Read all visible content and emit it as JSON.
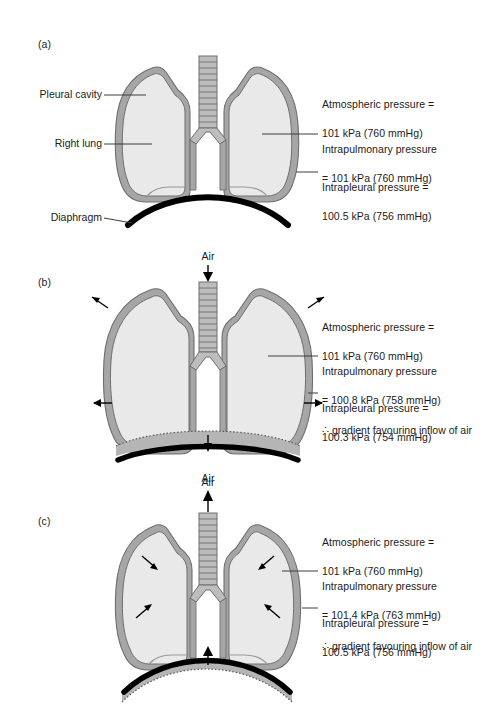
{
  "figure": {
    "background_color": "#ffffff",
    "lung_fill_color": "#e9e9e9",
    "pleura_color": "#a6a6a6",
    "diaphragm_color": "#000000",
    "outline_color": "#6e6e6e",
    "text_color": "#1b1b1b"
  },
  "panels": [
    {
      "id": "a",
      "label": "(a)",
      "state": "resting / end of expiration",
      "air_label_top": null,
      "air_label_bottom": null,
      "left_labels": [
        {
          "name": "pleural-cavity",
          "text": "Pleural cavity"
        },
        {
          "name": "right-lung",
          "text": "Right lung"
        },
        {
          "name": "diaphragm",
          "text": "Diaphragm"
        }
      ],
      "right_labels": [
        {
          "name": "atmospheric-pressure",
          "line1": "Atmospheric pressure =",
          "line2": "101 kPa (760 mmHg)",
          "leader": false
        },
        {
          "name": "intrapulmonary-pressure",
          "line1": "Intrapulmonary pressure",
          "line2": "= 101 kPa (760 mmHg)",
          "leader": true
        },
        {
          "name": "intrapleural-pressure",
          "line1": "Intrapleural pressure =",
          "line2": "100.5 kPa (756 mmHg)",
          "leader": true
        }
      ],
      "gradient_note": null
    },
    {
      "id": "b",
      "label": "(b)",
      "state": "inspiration",
      "air_label_top": "Air",
      "air_label_bottom": "Air",
      "left_labels": [],
      "right_labels": [
        {
          "name": "atmospheric-pressure",
          "line1": "Atmospheric pressure =",
          "line2": "101 kPa (760 mmHg)",
          "leader": false
        },
        {
          "name": "intrapulmonary-pressure",
          "line1": "Intrapulmonary pressure",
          "line2": "= 100.8 kPa (758 mmHg)",
          "leader": true
        },
        {
          "name": "intrapleural-pressure",
          "line1": "Intrapleural pressure =",
          "line2": "100.3 kPa (754 mmHg)",
          "leader": true
        }
      ],
      "gradient_note": "∴ gradient favouring inflow of air"
    },
    {
      "id": "c",
      "label": "(c)",
      "state": "expiration",
      "air_label_top": "Air",
      "air_label_bottom": null,
      "left_labels": [],
      "right_labels": [
        {
          "name": "atmospheric-pressure",
          "line1": "Atmospheric pressure =",
          "line2": "101 kPa (760 mmHg)",
          "leader": false
        },
        {
          "name": "intrapulmonary-pressure",
          "line1": "Intrapulmonary pressure",
          "line2": "= 101.4 kPa (763 mmHg)",
          "leader": true
        },
        {
          "name": "intrapleural-pressure",
          "line1": "Intrapleural pressure =",
          "line2": "100.5 kPa (756 mmHg)",
          "leader": true
        }
      ],
      "gradient_note": "∴ gradient favouring inflow of air"
    }
  ]
}
